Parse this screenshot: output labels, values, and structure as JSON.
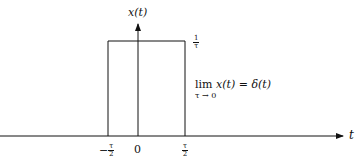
{
  "diagram": {
    "y_axis_label": "x(t)",
    "x_axis_label": "t",
    "height_label": {
      "num": "1",
      "den": "τ"
    },
    "ticks": [
      {
        "sign": "−",
        "num": "τ",
        "den": "2"
      },
      {
        "value": "0"
      },
      {
        "sign": "",
        "num": "τ",
        "den": "2"
      }
    ],
    "equation": {
      "lim": "lim",
      "lim_sub": "τ → 0",
      "expr": "x(t) = δ(t)"
    }
  }
}
